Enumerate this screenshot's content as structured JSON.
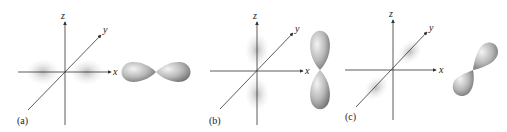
{
  "figure": {
    "panels": [
      {
        "label": "(a)",
        "orbital": "px",
        "axes": {
          "x": "x",
          "y": "y",
          "z": "z"
        }
      },
      {
        "label": "(b)",
        "orbital": "pz",
        "axes": {
          "x": "x",
          "y": "y",
          "z": "z"
        }
      },
      {
        "label": "(c)",
        "orbital": "py",
        "axes": {
          "x": "x",
          "y": "y",
          "z": "z"
        }
      }
    ]
  },
  "colors": {
    "axis": "#333333",
    "density": "#9a9a9a",
    "lobe_light": "#f2f2f2",
    "lobe_dark": "#7a7a7a"
  }
}
